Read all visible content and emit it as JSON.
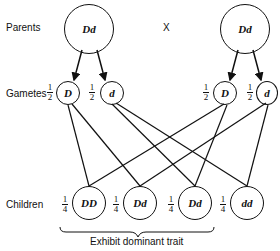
{
  "labels": {
    "parents": "Parents",
    "cross": "X",
    "gametes": "Gametes",
    "children": "Children",
    "brace_caption": "Exhibit dominant trait"
  },
  "parents": [
    {
      "genotype": "Dd"
    },
    {
      "genotype": "Dd"
    }
  ],
  "gametes": [
    {
      "allele": "D",
      "fraction": {
        "num": "1",
        "den": "2"
      }
    },
    {
      "allele": "d",
      "fraction": {
        "num": "1",
        "den": "2"
      }
    },
    {
      "allele": "D",
      "fraction": {
        "num": "1",
        "den": "2"
      }
    },
    {
      "allele": "d",
      "fraction": {
        "num": "1",
        "den": "2"
      }
    }
  ],
  "children": [
    {
      "genotype": "DD",
      "fraction": {
        "num": "1",
        "den": "4"
      }
    },
    {
      "genotype": "Dd",
      "fraction": {
        "num": "1",
        "den": "4"
      }
    },
    {
      "genotype": "Dd",
      "fraction": {
        "num": "1",
        "den": "4"
      }
    },
    {
      "genotype": "dd",
      "fraction": {
        "num": "1",
        "den": "4"
      }
    }
  ]
}
